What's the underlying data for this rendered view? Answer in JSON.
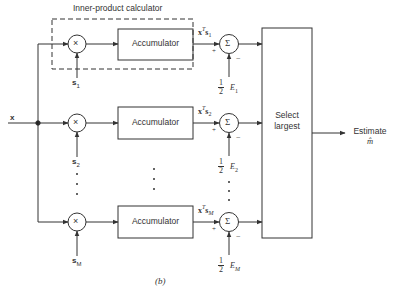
{
  "figure": {
    "caption": "(b)",
    "input_label": "x",
    "group_label": "Inner-product calculator",
    "multiplier_symbol": "×",
    "summer_symbol": "Σ",
    "accumulator_label": "Accumulator",
    "selector_label_line1": "Select",
    "selector_label_line2": "largest",
    "output_label_line1": "Estimate",
    "output_label_line2": "m̂",
    "plus_sign": "+",
    "minus_sign": "−",
    "half_num": "1",
    "half_den": "2",
    "ellipsis": "⋮",
    "branches": [
      {
        "signal": "s",
        "sub": "1",
        "product": "x",
        "product_sup": "T",
        "product_s": "s",
        "product_sub": "1",
        "energy": "E",
        "energy_sub": "1"
      },
      {
        "signal": "s",
        "sub": "2",
        "product": "x",
        "product_sup": "T",
        "product_s": "s",
        "product_sub": "2",
        "energy": "E",
        "energy_sub": "2"
      },
      {
        "signal": "s",
        "sub": "M",
        "product": "x",
        "product_sup": "T",
        "product_s": "s",
        "product_sub": "M",
        "energy": "E",
        "energy_sub": "M"
      }
    ]
  }
}
